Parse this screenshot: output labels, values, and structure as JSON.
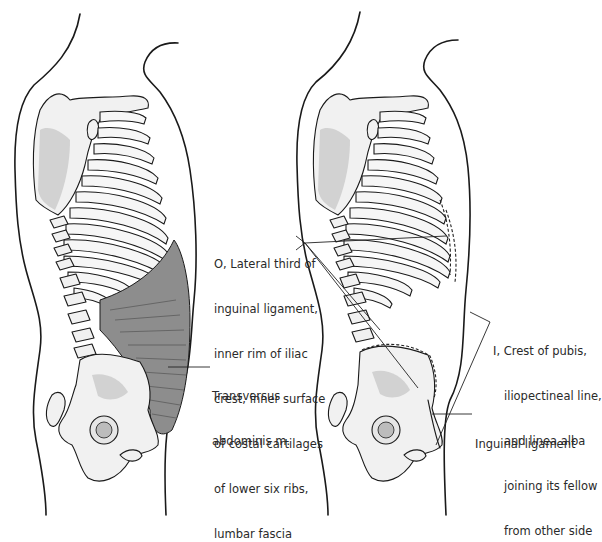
{
  "figure": {
    "panels": [
      {
        "id": "left",
        "description": "Lateral view of trunk showing transversus abdominis muscle",
        "labels": [
          {
            "key": "muscle",
            "lines": [
              "Transversus",
              "abdominis m."
            ]
          }
        ]
      },
      {
        "id": "right",
        "description": "Lateral view of trunk showing origin and insertion of transversus abdominis",
        "labels": [
          {
            "key": "origin",
            "lines": [
              "O, Lateral third of",
              "inguinal ligament,",
              "inner rim of iliac",
              "crest, inner surface",
              "of costal cartilages",
              "of lower six ribs,",
              "lumbar fascia"
            ]
          },
          {
            "key": "insertion",
            "lines": [
              "I, Crest of pubis,",
              "iliopectineal line,",
              "and linea alba",
              "joining its fellow",
              "from other side"
            ]
          },
          {
            "key": "ligament",
            "lines": [
              "Inguinal ligament"
            ]
          }
        ]
      }
    ],
    "colors": {
      "line": "#1a1a1a",
      "bone_fill": "#f1f1f1",
      "muscle_fill": "#8d8d8d",
      "text": "#2a2a2a"
    }
  }
}
